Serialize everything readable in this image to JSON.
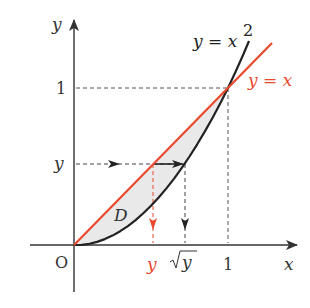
{
  "diagram": {
    "colors": {
      "axis": "#333333",
      "parabola": "#222222",
      "line": "#e8492f",
      "region_fill": "#e9e9e9",
      "guide": "#555555"
    },
    "axes": {
      "x_label": "x",
      "y_label": "y",
      "origin_label": "O"
    },
    "ticks": {
      "x_one": "1",
      "y_one": "1"
    },
    "curves": {
      "parabola_label": "y = x",
      "parabola_exp": "2",
      "line_label": "y = x"
    },
    "region_label": "D",
    "guides": {
      "y_level_label": "y",
      "x_line_label": "y",
      "x_sqrt_label": "y"
    }
  }
}
